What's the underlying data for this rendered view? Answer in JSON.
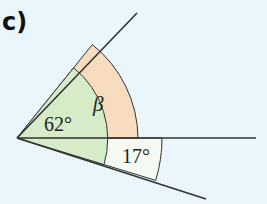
{
  "label": "c)",
  "angles": {
    "a62": {
      "text": "62°",
      "color": "#d6ecc8"
    },
    "beta": {
      "text": "β",
      "color": "#f8dcc0"
    },
    "a17": {
      "text": "17°",
      "color": "#f4faf2"
    }
  },
  "colors": {
    "background": "#eaf6fb",
    "line": "#333333"
  }
}
